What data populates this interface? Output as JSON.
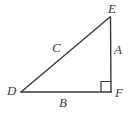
{
  "figure": {
    "background_color": "#ffffff",
    "stroke_color": "#3b3b3b",
    "label_color": "#3b3b3b",
    "stroke_width": 1.3
  },
  "vertices": {
    "E": {
      "label": "E",
      "x": 110,
      "y": 17
    },
    "D": {
      "label": "D",
      "x": 21,
      "y": 92
    },
    "F": {
      "label": "F",
      "x": 111,
      "y": 92
    }
  },
  "sides": {
    "A": {
      "label": "A",
      "from": "E",
      "to": "F"
    },
    "B": {
      "label": "B",
      "from": "D",
      "to": "F"
    },
    "C": {
      "label": "C",
      "from": "D",
      "to": "E"
    }
  },
  "right_angle": {
    "at_vertex": "F",
    "marker": "square",
    "size": 10
  }
}
